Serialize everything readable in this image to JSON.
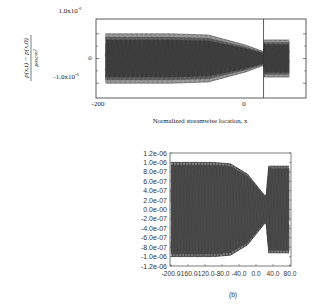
{
  "chart_data": [
    {
      "id": "a",
      "type": "line",
      "title": "",
      "xlabel": "Normalized streamwise location, x",
      "ylabel": "(p(x,t) - p(x,0)) / (ρ∞ c∞²)",
      "ylabel_numerator": "p(x,t) − p(x,0)",
      "ylabel_denominator": "ρ∞c∞²",
      "xlim": [
        -200,
        80
      ],
      "ylim": [
        -1.6e-06,
        1.6e-06
      ],
      "x_ticks": [
        {
          "value": -200,
          "label": "-200"
        },
        {
          "value": 0,
          "label": "0"
        }
      ],
      "y_ticks": [
        {
          "value": 1e-06,
          "label": "1.0x10",
          "exp": "-6"
        },
        {
          "value": 0,
          "label": "0",
          "exp": ""
        },
        {
          "value": -1e-06,
          "label": "-1.0x10",
          "exp": "-6"
        }
      ],
      "vertical_marker_x": 25,
      "grid": false,
      "legend": "none",
      "envelope": {
        "description": "Dense oscillating pressure traces at multiple times; amplitude envelope vs x",
        "x": [
          -190,
          -100,
          -50,
          0,
          25,
          26,
          60
        ],
        "amplitude": [
          1e-06,
          1e-06,
          9.5e-07,
          5.5e-07,
          2.8e-07,
          7.5e-07,
          7.5e-07
        ]
      },
      "series_count": 9
    },
    {
      "id": "b",
      "type": "line",
      "caption": "(b)",
      "title": "",
      "xlabel": "",
      "ylabel": "",
      "xlim": [
        -200,
        80
      ],
      "ylim": [
        -1.2e-06,
        1.2e-06
      ],
      "x_ticks": [
        {
          "value": -200,
          "label": "-200.0"
        },
        {
          "value": -160,
          "label": "-160.0"
        },
        {
          "value": -120,
          "label": "-120.0"
        },
        {
          "value": -80,
          "label": "-80.0"
        },
        {
          "value": -40,
          "label": "-40.0"
        },
        {
          "value": 0,
          "label": "0.0"
        },
        {
          "value": 40,
          "label": "40.0"
        },
        {
          "value": 80,
          "label": "80.0"
        }
      ],
      "y_ticks": [
        {
          "value": 1.2e-06,
          "label": "1.2e-06"
        },
        {
          "value": 1e-06,
          "label": "1.0e-06"
        },
        {
          "value": 8e-07,
          "label": "8.0e-07"
        },
        {
          "value": 6e-07,
          "label": "6.0e-07"
        },
        {
          "value": 4e-07,
          "label": "4.0e-07"
        },
        {
          "value": 2e-07,
          "label": "2.0e-07"
        },
        {
          "value": 0,
          "label": "0.0e-00"
        },
        {
          "value": -2e-07,
          "label": "-2.0e-07"
        },
        {
          "value": -4e-07,
          "label": "-4.0e-07"
        },
        {
          "value": -6e-07,
          "label": "-6.0e-07"
        },
        {
          "value": -8e-07,
          "label": "-8.0e-07"
        },
        {
          "value": -1e-06,
          "label": "-1.0e-06"
        },
        {
          "value": -1.2e-06,
          "label": "-1.2e-06"
        }
      ],
      "grid": false,
      "legend": "none",
      "envelope": {
        "description": "Oscillating pressure traces; amplitude envelope vs x",
        "x": [
          -200,
          -100,
          -60,
          -20,
          20,
          24,
          30,
          78
        ],
        "amplitude": [
          1e-06,
          1e-06,
          9.7e-07,
          7.5e-07,
          3e-07,
          3e-07,
          9.2e-07,
          9.2e-07
        ]
      },
      "series_count": 5
    }
  ]
}
